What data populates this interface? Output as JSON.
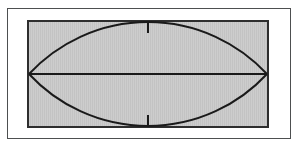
{
  "figure": {
    "colors": {
      "background": "#ffffff",
      "outer_frame_border": "#4d4f50",
      "panel_border": "#2e2e2e",
      "panel_fill_light": "#cdcdcd",
      "panel_fill_dark": "#c3c3c3",
      "line": "#1a1a1a"
    },
    "paths": {
      "top_arc": "M 0 52 A 162.2 162.2 0 0 1 238 52",
      "bottom_arc": "M 0 52 A 162.2 162.2 0 0 0 238 52",
      "midline": "M 0 52 L 238 52",
      "top_tick": "M 119 0 L 119 11",
      "bottom_tick": "M 119 104 L 119 93"
    },
    "stroke_color": "#1a1a1a"
  }
}
